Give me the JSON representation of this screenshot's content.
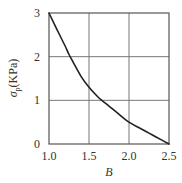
{
  "chart_data": {
    "type": "line",
    "title": "",
    "xlabel": "B",
    "ylabel": "σp(KPa)",
    "ylabel_main": "σ",
    "ylabel_sub": "p",
    "ylabel_unit": "(KPa)",
    "xlim": [
      1.0,
      2.5
    ],
    "ylim": [
      0,
      3
    ],
    "grid": true,
    "legend": null,
    "x_ticks": [
      1.0,
      1.5,
      2.0,
      2.5
    ],
    "x_tick_labels": [
      "1.0",
      "1.5",
      "2.0",
      "2.5"
    ],
    "y_ticks": [
      0,
      1,
      2,
      3
    ],
    "y_tick_labels": [
      "0",
      "1",
      "2",
      "3"
    ],
    "series": [
      {
        "name": "σp vs B",
        "color": "#222222",
        "x": [
          1.0,
          1.1,
          1.2,
          1.25,
          1.3,
          1.4,
          1.5,
          1.6,
          1.66,
          1.75,
          1.85,
          2.0,
          2.15,
          2.25,
          2.35,
          2.5
        ],
        "y": [
          3.0,
          2.62,
          2.25,
          2.05,
          1.88,
          1.55,
          1.3,
          1.1,
          1.0,
          0.87,
          0.72,
          0.5,
          0.35,
          0.25,
          0.15,
          0.0
        ]
      }
    ]
  },
  "colors": {
    "frame": "#555555",
    "grid": "#777777",
    "curve": "#222222",
    "text": "#333333"
  }
}
